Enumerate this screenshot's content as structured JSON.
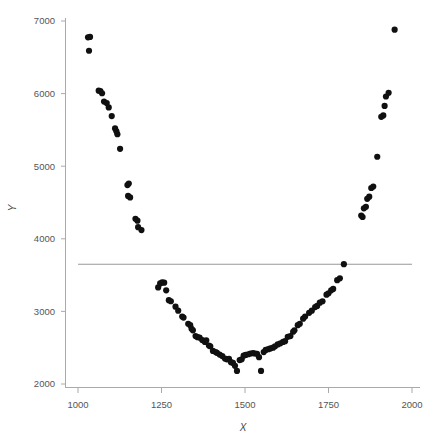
{
  "chart_data": {
    "type": "scatter",
    "title": "",
    "xlabel": "X",
    "ylabel": "Y",
    "xlim": [
      950,
      2030
    ],
    "ylim": [
      1900,
      7130
    ],
    "xticks": [
      1000,
      1250,
      1500,
      1750,
      2000
    ],
    "yticks": [
      2000,
      3000,
      4000,
      5000,
      6000,
      7000
    ],
    "xtick_labels": [
      "1000",
      "1250",
      "1500",
      "1750",
      "2000"
    ],
    "ytick_labels": [
      "2000",
      "3000",
      "4000",
      "5000",
      "6000",
      "7000"
    ],
    "grid": false,
    "legend": null,
    "marker": {
      "shape": "circle",
      "color": "#101010",
      "size": 3.1
    },
    "annotations": [
      {
        "type": "hline",
        "y": 3650,
        "x_start": 1000,
        "x_end": 1000,
        "color": "#999999",
        "label": ""
      }
    ],
    "series": [
      {
        "name": "observations",
        "color": "#101010",
        "points": [
          [
            1030,
            6775
          ],
          [
            1036,
            6780
          ],
          [
            1033,
            6590
          ],
          [
            1062,
            6040
          ],
          [
            1067,
            6035
          ],
          [
            1072,
            6005
          ],
          [
            1078,
            5890
          ],
          [
            1086,
            5870
          ],
          [
            1092,
            5810
          ],
          [
            1101,
            5690
          ],
          [
            1111,
            5520
          ],
          [
            1115,
            5480
          ],
          [
            1118,
            5440
          ],
          [
            1126,
            5240
          ],
          [
            1148,
            4740
          ],
          [
            1152,
            4760
          ],
          [
            1150,
            4590
          ],
          [
            1156,
            4570
          ],
          [
            1172,
            4275
          ],
          [
            1178,
            4250
          ],
          [
            1180,
            4160
          ],
          [
            1190,
            4120
          ],
          [
            1246,
            3385
          ],
          [
            1252,
            3400
          ],
          [
            1258,
            3395
          ],
          [
            1240,
            3330
          ],
          [
            1264,
            3290
          ],
          [
            1272,
            3155
          ],
          [
            1278,
            3140
          ],
          [
            1292,
            3065
          ],
          [
            1300,
            3010
          ],
          [
            1312,
            2930
          ],
          [
            1316,
            2915
          ],
          [
            1330,
            2830
          ],
          [
            1336,
            2810
          ],
          [
            1340,
            2760
          ],
          [
            1344,
            2740
          ],
          [
            1352,
            2660
          ],
          [
            1358,
            2645
          ],
          [
            1364,
            2640
          ],
          [
            1372,
            2605
          ],
          [
            1380,
            2580
          ],
          [
            1384,
            2600
          ],
          [
            1392,
            2530
          ],
          [
            1396,
            2520
          ],
          [
            1404,
            2455
          ],
          [
            1412,
            2440
          ],
          [
            1416,
            2430
          ],
          [
            1424,
            2405
          ],
          [
            1432,
            2385
          ],
          [
            1440,
            2350
          ],
          [
            1446,
            2340
          ],
          [
            1452,
            2345
          ],
          [
            1458,
            2300
          ],
          [
            1464,
            2290
          ],
          [
            1470,
            2250
          ],
          [
            1476,
            2180
          ],
          [
            1484,
            2330
          ],
          [
            1490,
            2340
          ],
          [
            1496,
            2390
          ],
          [
            1502,
            2400
          ],
          [
            1510,
            2410
          ],
          [
            1516,
            2420
          ],
          [
            1524,
            2425
          ],
          [
            1530,
            2420
          ],
          [
            1536,
            2415
          ],
          [
            1542,
            2370
          ],
          [
            1548,
            2180
          ],
          [
            1556,
            2440
          ],
          [
            1562,
            2470
          ],
          [
            1570,
            2480
          ],
          [
            1576,
            2490
          ],
          [
            1584,
            2500
          ],
          [
            1590,
            2520
          ],
          [
            1598,
            2545
          ],
          [
            1606,
            2560
          ],
          [
            1614,
            2580
          ],
          [
            1620,
            2590
          ],
          [
            1628,
            2650
          ],
          [
            1636,
            2660
          ],
          [
            1644,
            2720
          ],
          [
            1648,
            2740
          ],
          [
            1658,
            2810
          ],
          [
            1664,
            2830
          ],
          [
            1674,
            2900
          ],
          [
            1680,
            2930
          ],
          [
            1692,
            2980
          ],
          [
            1700,
            3010
          ],
          [
            1710,
            3060
          ],
          [
            1716,
            3075
          ],
          [
            1724,
            3120
          ],
          [
            1732,
            3140
          ],
          [
            1744,
            3230
          ],
          [
            1750,
            3250
          ],
          [
            1758,
            3290
          ],
          [
            1764,
            3310
          ],
          [
            1776,
            3430
          ],
          [
            1784,
            3455
          ],
          [
            1796,
            3650
          ],
          [
            1848,
            4320
          ],
          [
            1852,
            4300
          ],
          [
            1856,
            4420
          ],
          [
            1862,
            4440
          ],
          [
            1866,
            4550
          ],
          [
            1872,
            4580
          ],
          [
            1878,
            4700
          ],
          [
            1884,
            4720
          ],
          [
            1896,
            5130
          ],
          [
            1908,
            5680
          ],
          [
            1914,
            5700
          ],
          [
            1918,
            5830
          ],
          [
            1922,
            5960
          ],
          [
            1930,
            6010
          ],
          [
            1948,
            6880
          ]
        ]
      }
    ]
  },
  "axes": {
    "x_axis_label": "X",
    "y_axis_label": "Y"
  }
}
